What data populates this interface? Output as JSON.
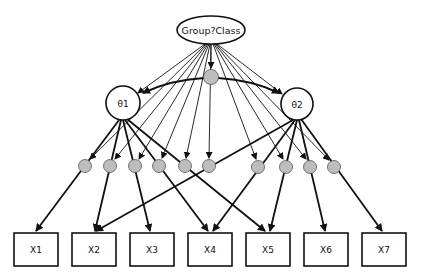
{
  "diagram": {
    "type": "structural-equation-model / mixture item response diagram",
    "group_node": {
      "label": "Group?Class",
      "cx": 211,
      "cy": 30,
      "rx": 34,
      "ry": 14
    },
    "central_node": {
      "cx": 211,
      "cy": 77,
      "r": 7.5,
      "fill": "#bdbdbd"
    },
    "latent_nodes": [
      {
        "id": "theta1",
        "label": "θ1",
        "cx": 123,
        "cy": 103,
        "r": 17
      },
      {
        "id": "theta2",
        "label": "θ2",
        "cx": 297,
        "cy": 104,
        "r": 16
      }
    ],
    "moderator_nodes": [
      {
        "cx": 85,
        "cy": 166
      },
      {
        "cx": 110,
        "cy": 166
      },
      {
        "cx": 135,
        "cy": 166
      },
      {
        "cx": 159,
        "cy": 166
      },
      {
        "cx": 185,
        "cy": 166
      },
      {
        "cx": 209,
        "cy": 166
      },
      {
        "cx": 258,
        "cy": 167
      },
      {
        "cx": 286,
        "cy": 167
      },
      {
        "cx": 310,
        "cy": 167
      },
      {
        "cx": 334,
        "cy": 167
      }
    ],
    "observed_nodes": [
      {
        "label": "X1",
        "x": 14,
        "y": 233,
        "w": 44,
        "h": 33
      },
      {
        "label": "X2",
        "x": 72,
        "y": 233,
        "w": 44,
        "h": 33
      },
      {
        "label": "X3",
        "x": 130,
        "y": 233,
        "w": 44,
        "h": 33
      },
      {
        "label": "X4",
        "x": 188,
        "y": 233,
        "w": 44,
        "h": 33
      },
      {
        "label": "X5",
        "x": 246,
        "y": 233,
        "w": 44,
        "h": 33
      },
      {
        "label": "X6",
        "x": 304,
        "y": 233,
        "w": 44,
        "h": 33
      },
      {
        "label": "X7",
        "x": 362,
        "y": 233,
        "w": 44,
        "h": 33
      }
    ],
    "colors": {
      "stroke": "#111111",
      "node_fill": "#ffffff",
      "grey_fill": "#bdbdbd"
    }
  }
}
